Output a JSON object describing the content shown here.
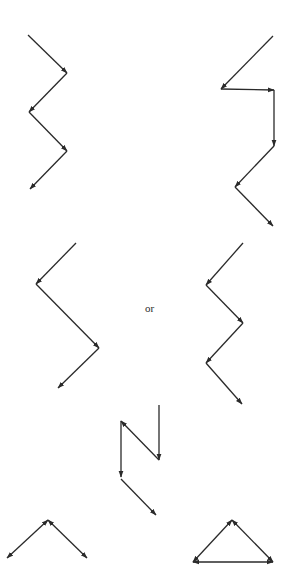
{
  "diagram": {
    "stroke_color": "#2a2a2a",
    "background": "#ffffff",
    "label_or": "or",
    "figures": [
      {
        "id": "zigzag-top-left",
        "segments": [
          {
            "from": [
              28,
              35
            ],
            "to": [
              67,
              73
            ],
            "head": "end"
          },
          {
            "from": [
              67,
              73
            ],
            "to": [
              29,
              112
            ],
            "head": "end"
          },
          {
            "from": [
              29,
              112
            ],
            "to": [
              67,
              151
            ],
            "head": "end"
          },
          {
            "from": [
              67,
              151
            ],
            "to": [
              30,
              189
            ],
            "head": "end"
          }
        ]
      },
      {
        "id": "zigzag-top-right",
        "segments": [
          {
            "from": [
              273,
              36
            ],
            "to": [
              221,
              89
            ],
            "head": "end"
          },
          {
            "from": [
              221,
              89
            ],
            "to": [
              274,
              90
            ],
            "head": "end"
          },
          {
            "from": [
              274,
              90
            ],
            "to": [
              274,
              146
            ],
            "head": "end"
          },
          {
            "from": [
              274,
              146
            ],
            "to": [
              235,
              187
            ],
            "head": "end"
          },
          {
            "from": [
              235,
              187
            ],
            "to": [
              273,
              226
            ],
            "head": "end"
          }
        ]
      },
      {
        "id": "zigzag-middle-left",
        "segments": [
          {
            "from": [
              76,
              243
            ],
            "to": [
              36,
              284
            ],
            "head": "end"
          },
          {
            "from": [
              36,
              284
            ],
            "to": [
              99,
              348
            ],
            "head": "end"
          },
          {
            "from": [
              99,
              348
            ],
            "to": [
              58,
              388
            ],
            "head": "end"
          }
        ]
      },
      {
        "id": "zigzag-middle-right",
        "segments": [
          {
            "from": [
              243,
              243
            ],
            "to": [
              206,
              285
            ],
            "head": "end"
          },
          {
            "from": [
              206,
              285
            ],
            "to": [
              243,
              323
            ],
            "head": "end"
          },
          {
            "from": [
              243,
              323
            ],
            "to": [
              206,
              363
            ],
            "head": "end"
          },
          {
            "from": [
              206,
              363
            ],
            "to": [
              242,
              404
            ],
            "head": "end"
          }
        ]
      },
      {
        "id": "n-shape-middle-bottom",
        "segments": [
          {
            "from": [
              159,
              405
            ],
            "to": [
              159,
              460
            ],
            "head": "end"
          },
          {
            "from": [
              159,
              460
            ],
            "to": [
              121,
              421
            ],
            "head": "end"
          },
          {
            "from": [
              121,
              421
            ],
            "to": [
              121,
              477
            ],
            "head": "end"
          },
          {
            "from": [
              121,
              479
            ],
            "to": [
              156,
              515
            ],
            "head": "end"
          }
        ]
      },
      {
        "id": "caret-bottom-left",
        "segments": [
          {
            "from": [
              48,
              520
            ],
            "to": [
              7,
              558
            ],
            "head": "both"
          },
          {
            "from": [
              48,
              520
            ],
            "to": [
              87,
              558
            ],
            "head": "both"
          }
        ]
      },
      {
        "id": "triangle-bottom-right",
        "segments": [
          {
            "from": [
              232,
              520
            ],
            "to": [
              193,
              562
            ],
            "head": "both"
          },
          {
            "from": [
              232,
              520
            ],
            "to": [
              273,
              562
            ],
            "head": "both"
          },
          {
            "from": [
              193,
              562
            ],
            "to": [
              273,
              562
            ],
            "head": "both"
          }
        ]
      }
    ]
  }
}
